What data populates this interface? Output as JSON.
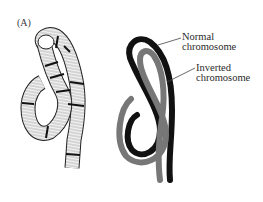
{
  "figure": {
    "panel_label": "(A)",
    "left_panel": {
      "description": "Banded polytene chromosome drawing showing inversion loop"
    },
    "right_panel": {
      "labels": {
        "normal_line1": "Normal",
        "normal_line2": "chromosome",
        "inverted_line1": "Inverted",
        "inverted_line2": "chromosome"
      },
      "colors": {
        "normal": "#111111",
        "inverted": "#777777"
      }
    }
  }
}
